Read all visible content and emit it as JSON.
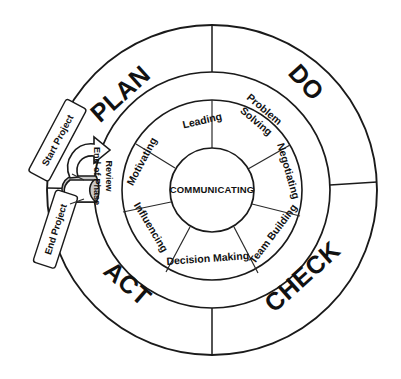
{
  "diagram": {
    "hub": {
      "label": "COMMUNICATING"
    },
    "outer_ring": {
      "segments": [
        {
          "label": "PLAN",
          "quadrant": "top-left"
        },
        {
          "label": "DO",
          "quadrant": "top-right"
        },
        {
          "label": "CHECK",
          "quadrant": "bottom-right"
        },
        {
          "label": "ACT",
          "quadrant": "bottom-left"
        }
      ]
    },
    "inner_ring": {
      "segments": [
        {
          "label": "Leading",
          "line1": "Leading",
          "line2": ""
        },
        {
          "label": "Problem Solving",
          "line1": "Problem",
          "line2": "Solving"
        },
        {
          "label": "Negotiating",
          "line1": "Negotiating",
          "line2": ""
        },
        {
          "label": "Team Building",
          "line1": "Team Building",
          "line2": ""
        },
        {
          "label": "Decision Making",
          "line1": "Decision Making",
          "line2": ""
        },
        {
          "label": "Influencing",
          "line1": "Influencing",
          "line2": ""
        },
        {
          "label": "Motivating",
          "line1": "Motivating",
          "line2": ""
        }
      ]
    },
    "callouts": [
      {
        "label": "Start Project"
      },
      {
        "label": "End Project"
      }
    ],
    "review_arrow": {
      "line1": "End-of-Phase",
      "line2": "Review"
    },
    "colors": {
      "stroke": "#1a1a1a",
      "background": "#ffffff",
      "arrow_shadow": "#c9c9c9"
    }
  }
}
